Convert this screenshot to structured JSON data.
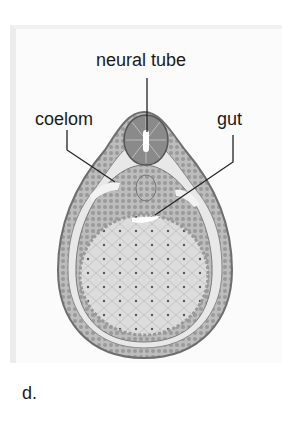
{
  "figure": {
    "panel_label": "d.",
    "labels": {
      "neural_tube": "neural tube",
      "coelom": "coelom",
      "gut": "gut"
    }
  }
}
